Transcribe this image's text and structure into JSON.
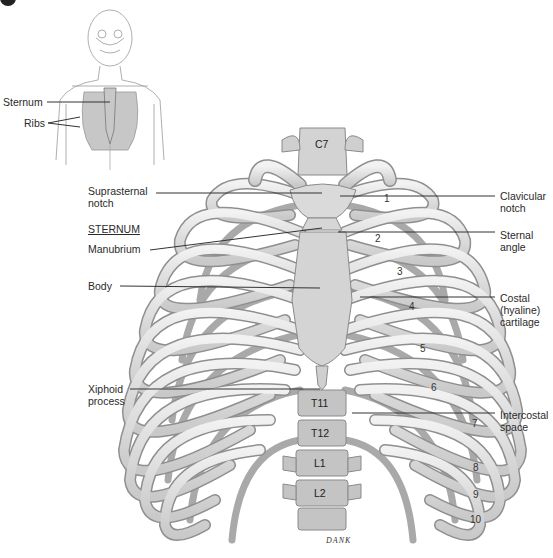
{
  "figure": {
    "inset": {
      "labels": [
        {
          "id": "sternum",
          "text": "Sternum",
          "x": 3,
          "y": 97
        },
        {
          "id": "ribs",
          "text": "Ribs",
          "x": 24,
          "y": 118
        }
      ]
    },
    "labels_left": [
      {
        "id": "suprasternal-notch",
        "lines": [
          "Suprasternal",
          "notch"
        ],
        "x": 88,
        "y": 186
      },
      {
        "id": "sternum-heading",
        "lines": [
          "STERNUM"
        ],
        "x": 88,
        "y": 224,
        "underline": true
      },
      {
        "id": "manubrium",
        "lines": [
          "Manubrium"
        ],
        "x": 88,
        "y": 243
      },
      {
        "id": "body",
        "lines": [
          "Body"
        ],
        "x": 88,
        "y": 281
      },
      {
        "id": "xiphoid-process",
        "lines": [
          "Xiphoid",
          "process"
        ],
        "x": 88,
        "y": 384
      }
    ],
    "labels_right": [
      {
        "id": "clavicular-notch",
        "lines": [
          "Clavicular",
          "notch"
        ],
        "x": 500,
        "y": 191
      },
      {
        "id": "sternal-angle",
        "lines": [
          "Sternal",
          "angle"
        ],
        "x": 500,
        "y": 230
      },
      {
        "id": "costal-cartilage",
        "lines": [
          "Costal",
          "(hyaline)",
          "cartilage"
        ],
        "x": 500,
        "y": 293
      },
      {
        "id": "intercostal-space",
        "lines": [
          "Intercostal",
          "space"
        ],
        "x": 500,
        "y": 410
      }
    ],
    "rib_numbers": [
      {
        "n": "1",
        "x": 384,
        "y": 195
      },
      {
        "n": "2",
        "x": 375,
        "y": 235
      },
      {
        "n": "3",
        "x": 397,
        "y": 268
      },
      {
        "n": "4",
        "x": 409,
        "y": 303
      },
      {
        "n": "5",
        "x": 420,
        "y": 345
      },
      {
        "n": "6",
        "x": 431,
        "y": 384
      },
      {
        "n": "7",
        "x": 472,
        "y": 420
      },
      {
        "n": "8",
        "x": 473,
        "y": 464
      },
      {
        "n": "9",
        "x": 473,
        "y": 491
      },
      {
        "n": "10",
        "x": 472,
        "y": 516
      }
    ],
    "vertebrae": [
      {
        "n": "C7",
        "x": 318,
        "y": 147
      },
      {
        "n": "T11",
        "x": 311,
        "y": 402
      },
      {
        "n": "T12",
        "x": 311,
        "y": 432
      },
      {
        "n": "L1",
        "x": 314,
        "y": 461
      },
      {
        "n": "L2",
        "x": 314,
        "y": 490
      }
    ],
    "signature": "DANK",
    "colors": {
      "bone": "#e6e6e6",
      "bone_shadow": "#a9a9a9",
      "bone_outline": "#8a8a8a",
      "sternum": "#d8d8d8",
      "leader": "#333333"
    }
  }
}
